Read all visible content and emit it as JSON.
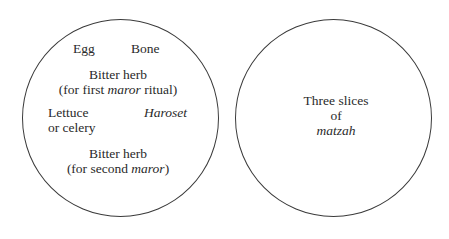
{
  "diagram": {
    "plates": [
      {
        "name": "Seder plate",
        "items": {
          "egg": "Egg",
          "bone": "Bone",
          "bitter_herb_first": {
            "line1": "Bitter herb",
            "line2_pre": "(for first ",
            "line2_italic": "maror",
            "line2_post": " ritual)"
          },
          "lettuce": {
            "line1": "Lettuce",
            "line2": "or celery"
          },
          "haroset": "Haroset",
          "bitter_herb_second": {
            "line1": "Bitter herb",
            "line2_pre": "(for second ",
            "line2_italic": "maror",
            "line2_post": ")"
          }
        }
      },
      {
        "name": "Matzah plate",
        "items": {
          "line1": "Three slices",
          "line2": "of",
          "line3_italic": "matzah"
        }
      }
    ],
    "colors": {
      "stroke": "#3a3a3a",
      "text": "#2a2a2a",
      "background": "#ffffff"
    }
  }
}
